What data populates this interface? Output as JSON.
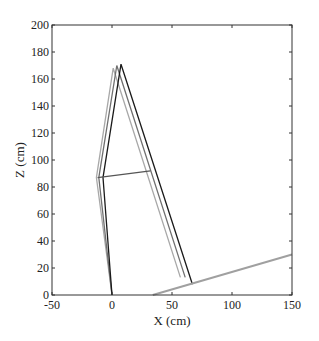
{
  "chart_data": {
    "type": "line",
    "title": "",
    "xlabel": "X (cm)",
    "ylabel": "Z (cm)",
    "xlim": [
      -50,
      150
    ],
    "ylim": [
      0,
      200
    ],
    "xticks": [
      -50,
      0,
      50,
      100,
      150
    ],
    "yticks": [
      0,
      20,
      40,
      60,
      80,
      100,
      120,
      140,
      160,
      180,
      200
    ],
    "grid": false,
    "legend": null,
    "series": [
      {
        "name": "posture-light",
        "color": "#a8a8a8",
        "points": [
          [
            0,
            0
          ],
          [
            -13,
            87
          ],
          [
            1,
            168
          ],
          [
            57,
            13
          ]
        ]
      },
      {
        "name": "posture-mid",
        "color": "#707070",
        "points": [
          [
            0,
            0
          ],
          [
            -11,
            87
          ],
          [
            4,
            170
          ],
          [
            61,
            13
          ]
        ]
      },
      {
        "name": "posture-dark",
        "color": "#1a1a1a",
        "points": [
          [
            0,
            0
          ],
          [
            -7.5,
            87
          ],
          [
            7.5,
            171
          ],
          [
            67,
            8
          ]
        ]
      },
      {
        "name": "crossbar",
        "color": "#555555",
        "points": [
          [
            -12,
            87
          ],
          [
            32,
            92
          ]
        ]
      },
      {
        "name": "ground-slope",
        "color": "#a0a0a0",
        "points": [
          [
            34,
            0
          ],
          [
            150,
            30
          ]
        ]
      }
    ]
  },
  "labels": {
    "xlabel": "X (cm)",
    "ylabel": "Z (cm)",
    "xticks": [
      "-50",
      "0",
      "50",
      "100",
      "150"
    ],
    "yticks": [
      "0",
      "20",
      "40",
      "60",
      "80",
      "100",
      "120",
      "140",
      "160",
      "180",
      "200"
    ]
  }
}
